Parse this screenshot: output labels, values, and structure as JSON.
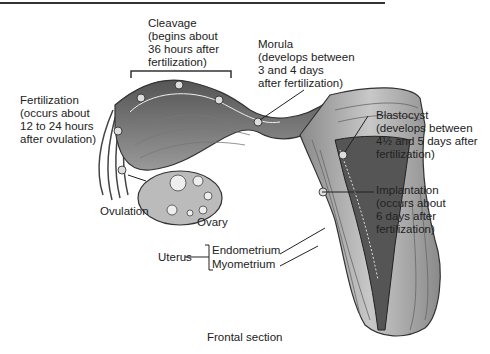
{
  "figure": {
    "caption": "Frontal section",
    "labels": {
      "cleavage": "Cleavage\n(begins about\n36 hours after\nfertilization)",
      "morula": "Morula\n(develops between\n3 and 4 days\nafter fertilization)",
      "fertilization": "Fertilization\n(occurs about\n12 to 24 hours\nafter ovulation)",
      "blastocyst": "Blastocyst\n(develops between\n4½ and 5 days after\nfertilization)",
      "implantation": "Implantation\n(occurs about\n6 days after\nfertilization)",
      "ovulation": "Ovulation",
      "ovary": "Ovary",
      "uterus": "Uterus",
      "endometrium": "Endometrium",
      "myometrium": "Myometrium"
    }
  }
}
